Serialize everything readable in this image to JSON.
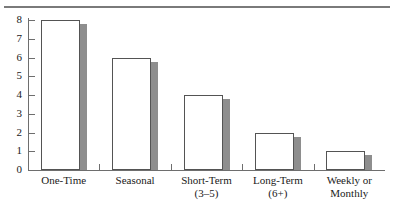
{
  "chart_data": {
    "type": "bar",
    "title": "",
    "subtitle": "",
    "xlabel": "",
    "ylabel": "",
    "categories": [
      "One-Time",
      "Seasonal",
      "Short-Term",
      "Long-Term",
      "Weekly or"
    ],
    "category_sublabels": [
      "",
      "",
      "(3–5)",
      "(6+)",
      "Monthly"
    ],
    "values": [
      8,
      6,
      4,
      2,
      1
    ],
    "ylim": [
      0,
      8
    ],
    "ytick_labels": [
      "8",
      "7",
      "6",
      "5",
      "4",
      "3",
      "2",
      "1",
      "0"
    ],
    "ytick_values": [
      8,
      7,
      6,
      5,
      4,
      3,
      2,
      1,
      0
    ],
    "grid": false,
    "legend": null,
    "series": [
      {
        "name": "",
        "values": [
          8,
          6,
          4,
          2,
          1
        ]
      }
    ],
    "colors": {
      "bar_fill": "#ffffff",
      "bar_outline": "#545454",
      "bar_shadow": "#8e8e8e",
      "axis": "#6e6e6e",
      "rule": "#7a7a7a",
      "text": "#1a1a1a"
    }
  }
}
